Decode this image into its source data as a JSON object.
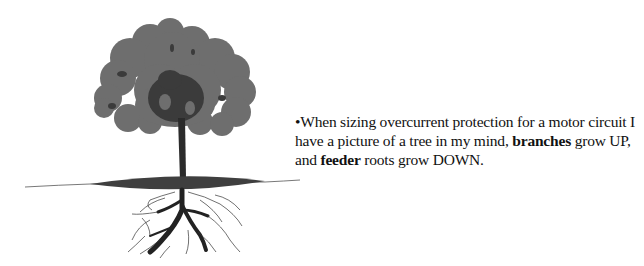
{
  "figure": {
    "icon": "tree-with-roots-icon",
    "colors": {
      "canopy": "#6e6e6e",
      "canopy_dark": "#3b3b3b",
      "trunk": "#2b2b2b",
      "ground": "#3f3f3f",
      "roots": "#222222"
    }
  },
  "text": {
    "bullet": "•",
    "segments": [
      {
        "text": "When sizing overcurrent protection for a motor circuit I have a picture of a tree in my mind, ",
        "bold": false
      },
      {
        "text": "branches",
        "bold": true
      },
      {
        "text": " grow UP, and ",
        "bold": false
      },
      {
        "text": "feeder",
        "bold": true
      },
      {
        "text": " roots grow DOWN.",
        "bold": false
      }
    ]
  }
}
